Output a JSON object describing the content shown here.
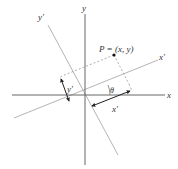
{
  "diagram": {
    "axes": {
      "x_label": "x",
      "y_label": "y",
      "x_prime_label": "x'",
      "y_prime_label": "y'"
    },
    "point": {
      "label": "P = (x, y)"
    },
    "measures": {
      "angle_label": "θ",
      "x_prime_distance_label": "x'",
      "y_prime_distance_label": "y'"
    },
    "colors": {
      "axis": "#555555",
      "rotated_axis": "#b0b0b0",
      "dashed": "#999999",
      "arrow": "#222222",
      "point": "#111111"
    }
  }
}
